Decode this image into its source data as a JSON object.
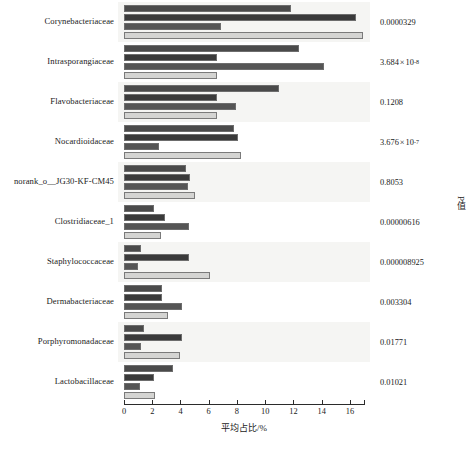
{
  "chart_data": {
    "type": "bar",
    "orientation": "horizontal",
    "title": "",
    "xlabel": "平均占比/%",
    "ylabel": "",
    "right_axis_label": "P值",
    "xlim": [
      0,
      17
    ],
    "xticks": [
      0,
      2,
      4,
      6,
      8,
      10,
      12,
      14,
      16
    ],
    "grid": false,
    "legend_position": "none",
    "categories": [
      "Corynebacteriaceae",
      "Intrasporangiaceae",
      "Flavobacteriaceae",
      "Nocardioidaceae",
      "norank_o__JG30-KF-CM45",
      "Clostridiaceae_1",
      "Staphylococcaceae",
      "Dermabacteriaceae",
      "Porphyromonadaceae",
      "Lactobacillaceae"
    ],
    "series": [
      {
        "name": "series1",
        "color": "#4a4a4a",
        "values": [
          11.8,
          12.4,
          11.0,
          7.8,
          4.4,
          2.1,
          1.2,
          2.7,
          1.4,
          3.5
        ]
      },
      {
        "name": "series2",
        "color": "#3a3a3a",
        "values": [
          16.4,
          6.6,
          6.6,
          8.1,
          4.7,
          2.9,
          4.6,
          2.7,
          4.1,
          2.1
        ]
      },
      {
        "name": "series3",
        "color": "#555555",
        "values": [
          6.9,
          14.2,
          7.9,
          2.5,
          4.5,
          4.6,
          1.0,
          4.1,
          1.2,
          1.1
        ]
      },
      {
        "name": "series4",
        "color": "#d4d4d2",
        "values": [
          16.9,
          6.6,
          6.6,
          8.3,
          5.0,
          2.6,
          6.1,
          3.1,
          4.0,
          2.2
        ]
      }
    ],
    "p_values": [
      {
        "text": "0.0000329",
        "mantissa": "0.0000329",
        "exponent": ""
      },
      {
        "text": "3.684×10⁻⁸",
        "mantissa": "3.684",
        "exponent": "-8"
      },
      {
        "text": "0.1208",
        "mantissa": "0.1208",
        "exponent": ""
      },
      {
        "text": "3.676×10⁻⁷",
        "mantissa": "3.676",
        "exponent": "-7"
      },
      {
        "text": "0.8053",
        "mantissa": "0.8053",
        "exponent": ""
      },
      {
        "text": "0.00000616",
        "mantissa": "0.00000616",
        "exponent": ""
      },
      {
        "text": "0.000008925",
        "mantissa": "0.000008925",
        "exponent": ""
      },
      {
        "text": "0.003304",
        "mantissa": "0.003304",
        "exponent": ""
      },
      {
        "text": "0.01771",
        "mantissa": "0.01771",
        "exponent": ""
      },
      {
        "text": "0.01021",
        "mantissa": "0.01021",
        "exponent": ""
      }
    ]
  }
}
